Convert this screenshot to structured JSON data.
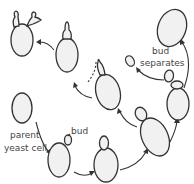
{
  "diagram": {
    "labels": {
      "parent_line1": "parent",
      "parent_line2": "yeast cell",
      "bud": "bud",
      "separates_line1": "bud",
      "separates_line2": "separates"
    },
    "colors": {
      "cell_fill": "#f1f1f1",
      "outline": "#333333",
      "text": "#444444"
    },
    "stages": [
      "parent yeast cell",
      "small bud forms",
      "bud grows",
      "bud enlarges",
      "bud nearly full size",
      "bud separates",
      "new cell",
      "new bud forms",
      "bud elongates",
      "cell with multiple buds"
    ]
  }
}
